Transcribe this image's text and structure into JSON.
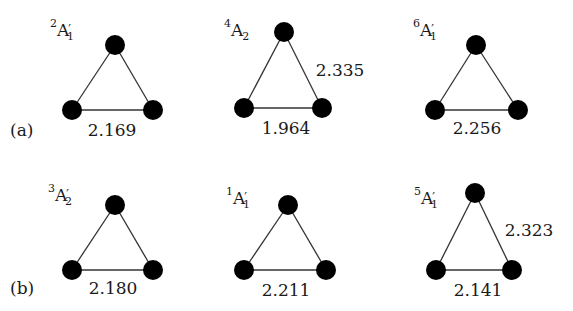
{
  "figure": {
    "rows": [
      {
        "label": "(a)",
        "structures": [
          {
            "spin": "2",
            "symbol": "A",
            "prime": "′",
            "subscript": "1",
            "base_distance": "2.169",
            "side_distance": ""
          },
          {
            "spin": "4",
            "symbol": "A",
            "prime": "",
            "subscript": "2",
            "base_distance": "1.964",
            "side_distance": "2.335"
          },
          {
            "spin": "6",
            "symbol": "A",
            "prime": "′",
            "subscript": "1",
            "base_distance": "2.256",
            "side_distance": ""
          }
        ]
      },
      {
        "label": "(b)",
        "structures": [
          {
            "spin": "3",
            "symbol": "A",
            "prime": "′",
            "subscript": "2",
            "base_distance": "2.180",
            "side_distance": ""
          },
          {
            "spin": "1",
            "symbol": "A",
            "prime": "′",
            "subscript": "1",
            "base_distance": "2.211",
            "side_distance": ""
          },
          {
            "spin": "5",
            "symbol": "A",
            "prime": "′",
            "subscript": "1",
            "base_distance": "2.141",
            "side_distance": "2.323"
          }
        ]
      }
    ],
    "colors": {
      "atom": "#000000",
      "bond": "#333333",
      "text": "#1a1a1a",
      "background": "#ffffff"
    }
  }
}
